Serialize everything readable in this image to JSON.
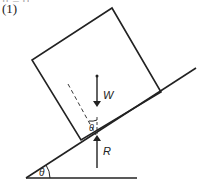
{
  "header": {
    "top_fragment": "μ = 0",
    "part_label": "(1)"
  },
  "diagram": {
    "labels": {
      "weight": "W",
      "reaction": "R",
      "block_angle": "θ",
      "incline_angle": "θ"
    },
    "colors": {
      "stroke": "#222222",
      "background": "#ffffff"
    }
  }
}
